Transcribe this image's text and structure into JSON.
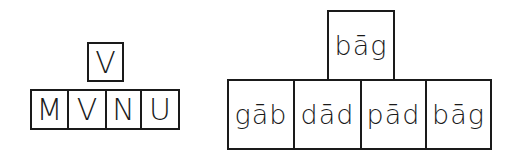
{
  "left_group": {
    "top": "V",
    "row": [
      "M",
      "V",
      "N",
      "U"
    ]
  },
  "right_group": {
    "top": "bāg",
    "row": [
      "gāb",
      "dād",
      "pād",
      "bāg"
    ]
  }
}
